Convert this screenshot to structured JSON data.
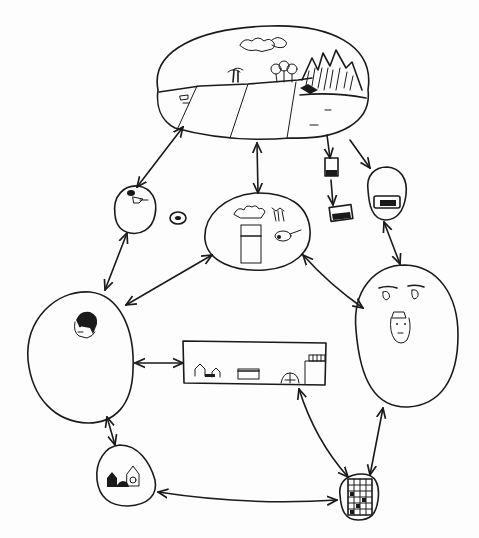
{
  "diagram": {
    "type": "hand-drawn node-link diagram",
    "style": "black ink sketch on white paper",
    "ink_color": "#1a1a1a",
    "background_color": "#fdfdfd",
    "text_labels": [],
    "nodes": [
      {
        "id": "landscape",
        "shape": "large oval",
        "content": "landscape with clouds, trees, fields and mountains",
        "center": [
          260,
          85
        ]
      },
      {
        "id": "small-blob-left",
        "shape": "small oval",
        "content": "small animal/figure sketch",
        "center": [
          135,
          210
        ]
      },
      {
        "id": "tiny-circle",
        "shape": "tiny circle",
        "content": "small scribble",
        "center": [
          178,
          218
        ]
      },
      {
        "id": "food",
        "shape": "oval",
        "content": "vegetables in a container, carrots, and meat drumstick",
        "center": [
          257,
          235
        ]
      },
      {
        "id": "photo-top",
        "shape": "small rectangle",
        "content": "small picture",
        "center": [
          332,
          168
        ]
      },
      {
        "id": "photo-bottom",
        "shape": "small rectangle",
        "content": "small picture",
        "center": [
          342,
          210
        ]
      },
      {
        "id": "vehicle-blob",
        "shape": "small oval",
        "content": "vehicle/object picture",
        "center": [
          387,
          195
        ]
      },
      {
        "id": "person-left",
        "shape": "large egg",
        "content": "face of a person with dark hair",
        "center": [
          78,
          355
        ]
      },
      {
        "id": "faces-right",
        "shape": "large egg",
        "content": "eyes and a face with a cap",
        "center": [
          405,
          335
        ]
      },
      {
        "id": "village",
        "shape": "rectangle",
        "content": "houses, a shop, a dome and a tall building",
        "center": [
          254,
          365
        ]
      },
      {
        "id": "houses-blob",
        "shape": "small egg",
        "content": "small houses",
        "center": [
          125,
          475
        ]
      },
      {
        "id": "building-blob",
        "shape": "small oval",
        "content": "tall apartment building with many windows",
        "center": [
          360,
          497
        ]
      }
    ],
    "edges": [
      {
        "from": "landscape",
        "to": "small-blob-left",
        "direction": "both"
      },
      {
        "from": "landscape",
        "to": "food",
        "direction": "both"
      },
      {
        "from": "landscape",
        "to": "photo-top",
        "direction": "forward"
      },
      {
        "from": "photo-top",
        "to": "photo-bottom",
        "direction": "forward"
      },
      {
        "from": "landscape",
        "to": "vehicle-blob",
        "direction": "forward"
      },
      {
        "from": "vehicle-blob",
        "to": "faces-right",
        "direction": "both"
      },
      {
        "from": "small-blob-left",
        "to": "person-left",
        "direction": "both"
      },
      {
        "from": "food",
        "to": "person-left",
        "direction": "both"
      },
      {
        "from": "food",
        "to": "faces-right",
        "direction": "both"
      },
      {
        "from": "person-left",
        "to": "village",
        "direction": "both"
      },
      {
        "from": "person-left",
        "to": "houses-blob",
        "direction": "both"
      },
      {
        "from": "village",
        "to": "building-blob",
        "direction": "both"
      },
      {
        "from": "faces-right",
        "to": "building-blob",
        "direction": "both"
      },
      {
        "from": "houses-blob",
        "to": "building-blob",
        "direction": "both"
      }
    ]
  }
}
